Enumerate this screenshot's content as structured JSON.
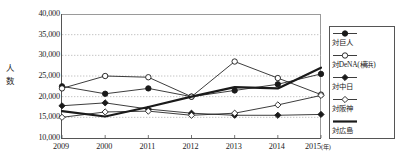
{
  "chart_data": {
    "type": "line",
    "title": "",
    "xlabel": "年",
    "ylabel": "人数",
    "x": [
      "2009",
      "2000",
      "2011",
      "2012",
      "2013",
      "2014",
      "2015"
    ],
    "xtick_labels": [
      "2009",
      "2000",
      "2011",
      "2012",
      "2013",
      "2014",
      "2015"
    ],
    "x_unit_label": "(年)",
    "ylim": [
      10000,
      40000
    ],
    "ytick_labels": [
      "40,000",
      "35,000",
      "30,000",
      "25,000",
      "20,000",
      "15,000",
      "10,000"
    ],
    "ytick_values": [
      40000,
      35000,
      30000,
      25000,
      20000,
      15000,
      10000
    ],
    "grid": true,
    "grid_style": "dotted-horizontal",
    "legend_position": "right",
    "series": [
      {
        "name": "対巨人",
        "marker": "filled-circle",
        "line": "thin",
        "values": [
          22500,
          20700,
          22000,
          20000,
          21500,
          23000,
          25500
        ]
      },
      {
        "name": "対DeNA(横浜)",
        "marker": "open-circle",
        "line": "thin",
        "values": [
          22000,
          25000,
          24700,
          20000,
          28500,
          24500,
          20500
        ]
      },
      {
        "name": "対中日",
        "marker": "filled-diamond",
        "line": "thin",
        "values": [
          17800,
          18500,
          17000,
          16000,
          15500,
          15500,
          15700
        ]
      },
      {
        "name": "対阪神",
        "marker": "open-diamond",
        "line": "thin",
        "values": [
          15000,
          16300,
          16500,
          15500,
          16000,
          18000,
          20300
        ]
      },
      {
        "name": "対広島",
        "marker": "none",
        "line": "thick",
        "values": [
          16500,
          15200,
          17500,
          20000,
          22300,
          22000,
          27000
        ]
      }
    ]
  },
  "legend": {
    "items": [
      {
        "label": "対巨人",
        "marker": "filled-circle"
      },
      {
        "label": "対DeNA(横浜)",
        "marker": "open-circle"
      },
      {
        "label": "対中日",
        "marker": "filled-diamond"
      },
      {
        "label": "対阪神",
        "marker": "open-diamond"
      },
      {
        "label": "対広島",
        "marker": "none"
      }
    ]
  },
  "colors": {
    "ink": "#1a1a1a",
    "axis": "#555555",
    "grid": "#b5b5b5",
    "background": "#ffffff"
  }
}
